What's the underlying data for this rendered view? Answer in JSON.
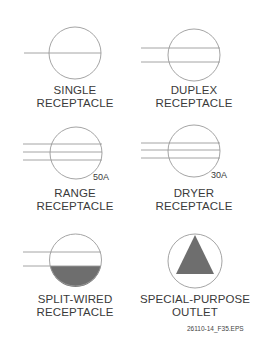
{
  "symbols": [
    {
      "id": "single",
      "line1": "SINGLE",
      "line2": "RECEPTACLE"
    },
    {
      "id": "duplex",
      "line1": "DUPLEX",
      "line2": "RECEPTACLE"
    },
    {
      "id": "range",
      "line1": "RANGE",
      "line2": "RECEPTACLE",
      "rating": "50A"
    },
    {
      "id": "dryer",
      "line1": "DRYER",
      "line2": "RECEPTACLE",
      "rating": "30A"
    },
    {
      "id": "split-wired",
      "line1": "SPLIT-WIRED",
      "line2": "RECEPTACLE"
    },
    {
      "id": "special-purpose",
      "line1": "SPECIAL-PURPOSE",
      "line2": "OUTLET"
    }
  ],
  "figure_id": "26110-14_F35.EPS",
  "colors": {
    "stroke": "#9a9a9a",
    "fill": "#6e6e6e",
    "text": "#3a3a3a"
  }
}
